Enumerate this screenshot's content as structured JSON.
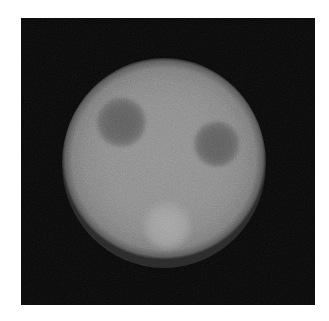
{
  "figure": {
    "modality_label": "",
    "background_color": "#050505",
    "page_color": "#ffffff",
    "border_color": "#d9d9d9"
  },
  "canvas": {
    "width_px": 329,
    "height_px": 321,
    "field_left_px": 21,
    "field_top_px": 18,
    "field_width_px": 294,
    "field_height_px": 287
  },
  "chart_data": {
    "type": "heatmap",
    "xlabel": "",
    "ylabel": "",
    "colormap": "grayscale",
    "value_range": [
      0,
      255
    ],
    "background_value": 5,
    "noise": "gaussian speckle",
    "regions": [
      {
        "name": "background-field",
        "shape": "rectangle",
        "label": "dark background",
        "center_px": [
          164,
          161
        ],
        "width_px": 294,
        "height_px": 287,
        "intensity": 5,
        "color": "#050505"
      },
      {
        "name": "phantom-disc",
        "shape": "circle",
        "label": "uniform activity disc",
        "center_px": [
          164,
          163
        ],
        "radius_x_px": 102,
        "radius_y_px": 105,
        "intensity": 140,
        "color": "#8c8c8c"
      },
      {
        "name": "cold-spot-left",
        "shape": "circle",
        "label": "cold lesion (upper left)",
        "center_px": [
          121,
          122
        ],
        "radius_px": 26,
        "intensity": 96,
        "color": "#606060"
      },
      {
        "name": "cold-spot-right",
        "shape": "circle",
        "label": "cold lesion (right)",
        "center_px": [
          217,
          144
        ],
        "radius_px": 24,
        "intensity": 99,
        "color": "#636363"
      },
      {
        "name": "hot-spot-lower",
        "shape": "circle",
        "label": "hot lesion (lower center)",
        "center_px": [
          167,
          225
        ],
        "radius_px": 26,
        "intensity": 162,
        "color": "#a2a2a2"
      }
    ]
  },
  "legend": {
    "visible": false,
    "entries": []
  },
  "axes": {
    "visible": false,
    "xticks": [],
    "yticks": []
  },
  "annotations": []
}
